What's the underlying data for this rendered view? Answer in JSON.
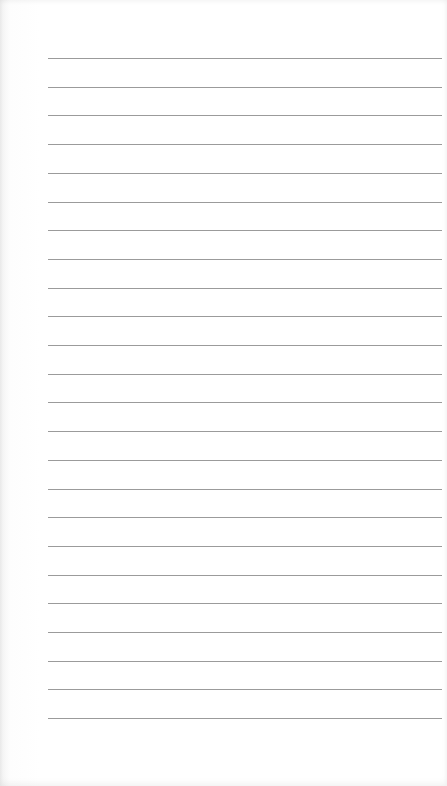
{
  "document": {
    "type": "lined-paper",
    "background_color": "#ffffff",
    "line_color": "#8a8a8a",
    "line_count": 24,
    "first_line_y": 58,
    "line_spacing": 28.7,
    "line_left": 48,
    "line_width": 394,
    "text": []
  }
}
